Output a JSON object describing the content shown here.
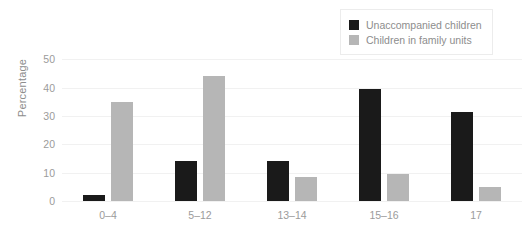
{
  "chart_data": {
    "type": "bar",
    "title": "",
    "subtitle": "",
    "xlabel": "",
    "ylabel": "Percentage",
    "categories": [
      "0–4",
      "5–12",
      "13–14",
      "15–16",
      "17"
    ],
    "series": [
      {
        "name": "Unaccompanied children",
        "color": "#1a1a1a",
        "values": [
          2,
          14,
          14,
          39.5,
          31.5
        ]
      },
      {
        "name": "Children in family units",
        "color": "#b6b6b6",
        "values": [
          35,
          44,
          8.5,
          9.5,
          5
        ]
      }
    ],
    "ylim": [
      0,
      55
    ],
    "yticks": [
      0,
      10,
      20,
      30,
      40,
      50
    ],
    "ytick_labels": [
      "0",
      "10",
      "20",
      "30",
      "40",
      "50"
    ],
    "grid": true,
    "grid_axis": "y",
    "legend_position": "top-right"
  },
  "legend": {
    "items": [
      {
        "label": "Unaccompanied children"
      },
      {
        "label": "Children in family units"
      }
    ]
  }
}
